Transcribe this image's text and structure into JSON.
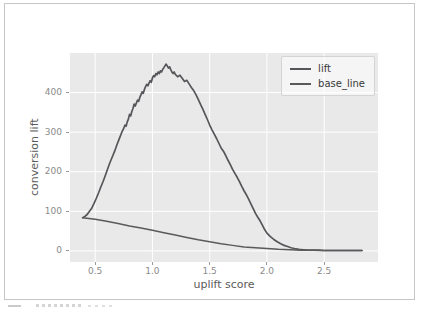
{
  "page": {
    "background": "#ffffff",
    "frame_border_color": "#c6c6c6"
  },
  "chart_data": {
    "type": "line",
    "title": "",
    "xlabel": "uplift score",
    "ylabel": "conversion lift",
    "xlim": [
      0.28,
      2.97
    ],
    "ylim": [
      -28,
      500
    ],
    "grid": true,
    "grid_color": "#ffffff",
    "plot_background": "#e9e9e9",
    "legend_position": "upper right",
    "xticks": [
      {
        "label": "0.5",
        "value": 0.5
      },
      {
        "label": "1.0",
        "value": 1.0
      },
      {
        "label": "1.5",
        "value": 1.5
      },
      {
        "label": "2.0",
        "value": 2.0
      },
      {
        "label": "2.5",
        "value": 2.5
      }
    ],
    "yticks": [
      {
        "label": "0",
        "value": 0
      },
      {
        "label": "100",
        "value": 100
      },
      {
        "label": "200",
        "value": 200
      },
      {
        "label": "300",
        "value": 300
      },
      {
        "label": "400",
        "value": 400
      }
    ],
    "series": [
      {
        "name": "lift",
        "color": "#56565a",
        "width": 1.7,
        "points": [
          [
            0.39,
            84
          ],
          [
            0.41,
            87
          ],
          [
            0.43,
            92
          ],
          [
            0.45,
            100
          ],
          [
            0.47,
            108
          ],
          [
            0.49,
            120
          ],
          [
            0.51,
            133
          ],
          [
            0.53,
            147
          ],
          [
            0.55,
            162
          ],
          [
            0.57,
            176
          ],
          [
            0.59,
            192
          ],
          [
            0.61,
            208
          ],
          [
            0.63,
            224
          ],
          [
            0.65,
            238
          ],
          [
            0.67,
            252
          ],
          [
            0.69,
            268
          ],
          [
            0.71,
            283
          ],
          [
            0.73,
            298
          ],
          [
            0.75,
            310
          ],
          [
            0.76,
            318
          ],
          [
            0.77,
            315
          ],
          [
            0.78,
            326
          ],
          [
            0.79,
            333
          ],
          [
            0.8,
            345
          ],
          [
            0.81,
            341
          ],
          [
            0.82,
            352
          ],
          [
            0.83,
            360
          ],
          [
            0.84,
            371
          ],
          [
            0.85,
            366
          ],
          [
            0.86,
            374
          ],
          [
            0.87,
            381
          ],
          [
            0.88,
            378
          ],
          [
            0.89,
            388
          ],
          [
            0.9,
            395
          ],
          [
            0.91,
            402
          ],
          [
            0.92,
            398
          ],
          [
            0.93,
            408
          ],
          [
            0.94,
            415
          ],
          [
            0.95,
            421
          ],
          [
            0.96,
            417
          ],
          [
            0.97,
            424
          ],
          [
            0.98,
            430
          ],
          [
            0.99,
            426
          ],
          [
            1.0,
            437
          ],
          [
            1.01,
            443
          ],
          [
            1.02,
            440
          ],
          [
            1.03,
            448
          ],
          [
            1.04,
            445
          ],
          [
            1.05,
            452
          ],
          [
            1.06,
            448
          ],
          [
            1.07,
            455
          ],
          [
            1.08,
            452
          ],
          [
            1.09,
            459
          ],
          [
            1.1,
            463
          ],
          [
            1.11,
            468
          ],
          [
            1.12,
            472
          ],
          [
            1.13,
            467
          ],
          [
            1.14,
            462
          ],
          [
            1.15,
            465
          ],
          [
            1.16,
            458
          ],
          [
            1.17,
            452
          ],
          [
            1.18,
            448
          ],
          [
            1.19,
            452
          ],
          [
            1.2,
            446
          ],
          [
            1.22,
            440
          ],
          [
            1.24,
            444
          ],
          [
            1.26,
            436
          ],
          [
            1.28,
            428
          ],
          [
            1.3,
            431
          ],
          [
            1.32,
            422
          ],
          [
            1.34,
            413
          ],
          [
            1.36,
            405
          ],
          [
            1.38,
            395
          ],
          [
            1.4,
            383
          ],
          [
            1.42,
            370
          ],
          [
            1.44,
            358
          ],
          [
            1.46,
            345
          ],
          [
            1.48,
            332
          ],
          [
            1.5,
            318
          ],
          [
            1.52,
            306
          ],
          [
            1.54,
            295
          ],
          [
            1.56,
            284
          ],
          [
            1.58,
            272
          ],
          [
            1.6,
            260
          ],
          [
            1.62,
            252
          ],
          [
            1.64,
            241
          ],
          [
            1.66,
            229
          ],
          [
            1.68,
            218
          ],
          [
            1.7,
            206
          ],
          [
            1.72,
            196
          ],
          [
            1.74,
            186
          ],
          [
            1.76,
            175
          ],
          [
            1.78,
            163
          ],
          [
            1.8,
            152
          ],
          [
            1.82,
            142
          ],
          [
            1.84,
            131
          ],
          [
            1.86,
            119
          ],
          [
            1.88,
            107
          ],
          [
            1.9,
            95
          ],
          [
            1.92,
            85
          ],
          [
            1.94,
            76
          ],
          [
            1.96,
            65
          ],
          [
            1.98,
            54
          ],
          [
            2.0,
            45
          ],
          [
            2.03,
            36
          ],
          [
            2.06,
            29
          ],
          [
            2.09,
            23
          ],
          [
            2.12,
            18
          ],
          [
            2.15,
            14
          ],
          [
            2.18,
            11
          ],
          [
            2.21,
            8
          ],
          [
            2.24,
            6
          ],
          [
            2.28,
            4
          ],
          [
            2.32,
            3
          ],
          [
            2.36,
            2
          ],
          [
            2.4,
            2
          ],
          [
            2.45,
            2
          ],
          [
            2.5,
            1
          ],
          [
            2.6,
            1
          ],
          [
            2.7,
            1
          ],
          [
            2.83,
            1
          ]
        ]
      },
      {
        "name": "base_line",
        "color": "#5a5a5c",
        "width": 1.5,
        "points": [
          [
            0.39,
            84
          ],
          [
            0.5,
            80
          ],
          [
            0.6,
            75
          ],
          [
            0.7,
            69
          ],
          [
            0.8,
            63
          ],
          [
            0.9,
            58
          ],
          [
            1.0,
            52
          ],
          [
            1.1,
            46
          ],
          [
            1.2,
            40
          ],
          [
            1.3,
            34
          ],
          [
            1.4,
            28
          ],
          [
            1.5,
            23
          ],
          [
            1.6,
            18
          ],
          [
            1.7,
            14
          ],
          [
            1.8,
            10
          ],
          [
            1.9,
            8
          ],
          [
            2.0,
            6
          ],
          [
            2.1,
            4
          ],
          [
            2.2,
            3
          ],
          [
            2.3,
            2
          ],
          [
            2.4,
            2
          ],
          [
            2.5,
            1
          ],
          [
            2.6,
            1
          ],
          [
            2.83,
            1
          ]
        ]
      }
    ],
    "axis_style": {
      "tick_label_color": "#8a8a8a",
      "axis_label_color": "#5b5b5b",
      "tick_mark_color": "#9a9a9a"
    }
  }
}
